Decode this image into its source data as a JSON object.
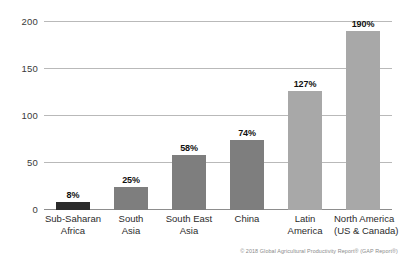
{
  "chart_data": {
    "type": "bar",
    "title": "",
    "subtitle": "",
    "xlabel": "",
    "ylabel": "",
    "ylim": [
      0,
      200
    ],
    "yticks": [
      "0",
      "50",
      "100",
      "150",
      "200"
    ],
    "ytick_values": [
      0,
      50,
      100,
      150,
      200
    ],
    "grid": true,
    "legend": "none",
    "categories": [
      "Sub-Saharan Africa",
      "South Asia",
      "South East Asia",
      "China",
      "Latin America",
      "North America (US & Canada)"
    ],
    "category_lines": [
      [
        "Sub-Saharan",
        "Africa"
      ],
      [
        "South",
        "Asia"
      ],
      [
        "South East",
        "Asia"
      ],
      [
        "China",
        ""
      ],
      [
        "Latin",
        "America"
      ],
      [
        "North America",
        "(US & Canada)"
      ]
    ],
    "values": [
      8,
      25,
      58,
      74,
      127,
      190
    ],
    "data_labels": [
      "8%",
      "25%",
      "58%",
      "74%",
      "127%",
      "190%"
    ],
    "bar_colors": [
      "#2b2b2b",
      "#7e7e7e",
      "#7e7e7e",
      "#7e7e7e",
      "#a8a8a8",
      "#a8a8a8"
    ]
  },
  "footer": {
    "credit": "© 2018 Global Agricultural Productivity Report® (GAP Report®)"
  },
  "colors": {
    "gridline": "#b9b9b9",
    "axis": "#8d8d8d",
    "tick_text": "#3a3a3a",
    "label_text": "#2b2b2b",
    "value_text": "#111111",
    "background": "#ffffff"
  }
}
